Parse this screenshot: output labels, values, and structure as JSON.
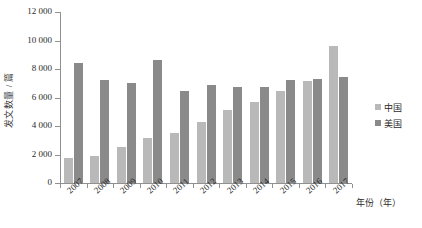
{
  "chart_data": {
    "type": "bar",
    "title": "",
    "xlabel": "年份（年）",
    "ylabel": "发文数量 / 篇",
    "categories": [
      "2007",
      "2008",
      "2009",
      "2010",
      "2011",
      "2012",
      "2013",
      "2014",
      "2015",
      "2016",
      "2017"
    ],
    "series": [
      {
        "name": "中国",
        "color": "#b9b9b9",
        "values": [
          1750,
          1900,
          2500,
          3150,
          3500,
          4250,
          5100,
          5700,
          6450,
          7150,
          9650
        ]
      },
      {
        "name": "美国",
        "color": "#8a8a8a",
        "values": [
          8400,
          7200,
          7050,
          8650,
          6450,
          6850,
          6750,
          6750,
          7200,
          7300,
          7450
        ]
      }
    ],
    "ylim": [
      0,
      12000
    ],
    "yticks": [
      0,
      2000,
      4000,
      6000,
      8000,
      10000,
      12000
    ],
    "ytick_labels": [
      "0",
      "2 000",
      "4 000",
      "6 000",
      "8 000",
      "10 000",
      "12 000"
    ],
    "grid": false,
    "legend_position": "right"
  }
}
